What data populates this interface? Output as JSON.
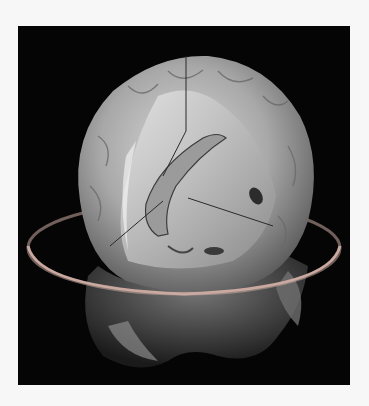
{
  "figure": {
    "background_color": "#050505",
    "page_color": "#f7f7f7",
    "ring_color": "#c9a9a0"
  }
}
